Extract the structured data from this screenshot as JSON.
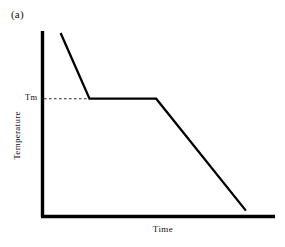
{
  "figure": {
    "panel_label": "(a)",
    "background_color": "#ffffff",
    "line_color": "#000000"
  },
  "chart_data": {
    "type": "line",
    "title": "(a)",
    "xlabel": "Time",
    "ylabel": "Temperature",
    "grid": false,
    "legend": null,
    "axis_ticks_x": [],
    "axis_ticks_y": [
      "Tm"
    ],
    "annotations": [
      {
        "name": "tm-tick-label",
        "text": "Tm",
        "description": "melting/freezing temperature level marked on the temperature axis"
      },
      {
        "name": "tm-guide-line",
        "text": "",
        "style": "dashed",
        "description": "horizontal dashed guide from the temperature axis to the start of the arrest plateau"
      }
    ],
    "series": [
      {
        "name": "cooling curve",
        "style": "solid",
        "color": "#000000",
        "points": [
          {
            "x": 0.078,
            "y": 0.989,
            "stage": "liquid cooling start"
          },
          {
            "x": 0.202,
            "y": 0.635,
            "stage": "onset of solidification (Tm)"
          },
          {
            "x": 0.489,
            "y": 0.635,
            "stage": "end of thermal arrest plateau (Tm)"
          },
          {
            "x": 0.875,
            "y": 0.032,
            "stage": "solid cooling end"
          }
        ]
      }
    ],
    "axes": {
      "x_axis_visible": true,
      "y_axis_visible": true,
      "x_range_normalized": [
        0,
        1
      ],
      "y_range_normalized": [
        0,
        1
      ],
      "ticks_shown": false
    }
  }
}
